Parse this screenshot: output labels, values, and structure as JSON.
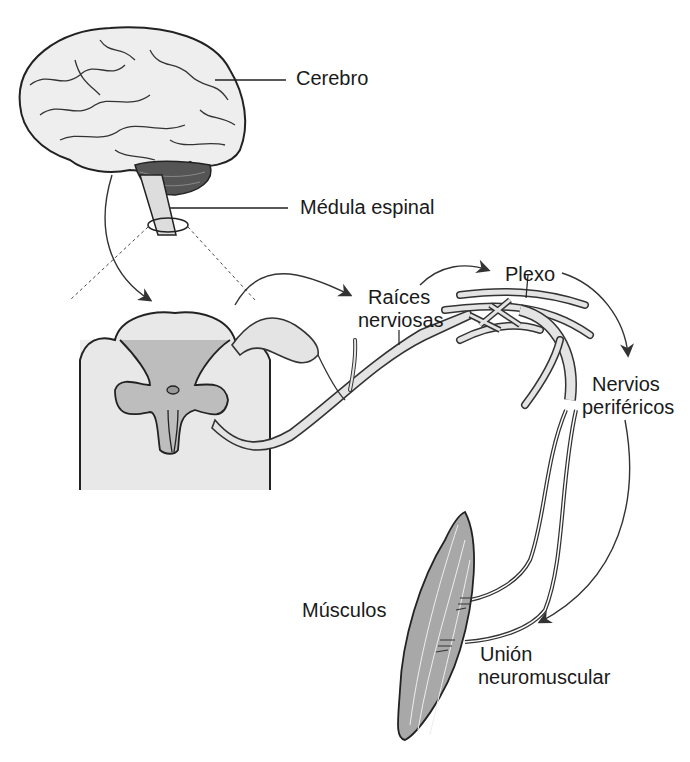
{
  "diagram": {
    "colors": {
      "background": "#ffffff",
      "brain_fill": "#eeeeee",
      "cerebellum_fill": "#555555",
      "white_matter": "#e8e8e8",
      "gray_matter": "#bdbdbd",
      "muscle_fill": "#a8a8a8",
      "line": "#222222"
    },
    "labels": {
      "cerebro": "Cerebro",
      "medula": "Médula espinal",
      "raices_line1": "Raíces",
      "raices_line2": "nerviosas",
      "plexo": "Plexo",
      "nervios_line1": "Nervios",
      "nervios_line2": "periféricos",
      "musculos": "Músculos",
      "union_line1": "Unión",
      "union_line2": "neuromuscular"
    }
  }
}
